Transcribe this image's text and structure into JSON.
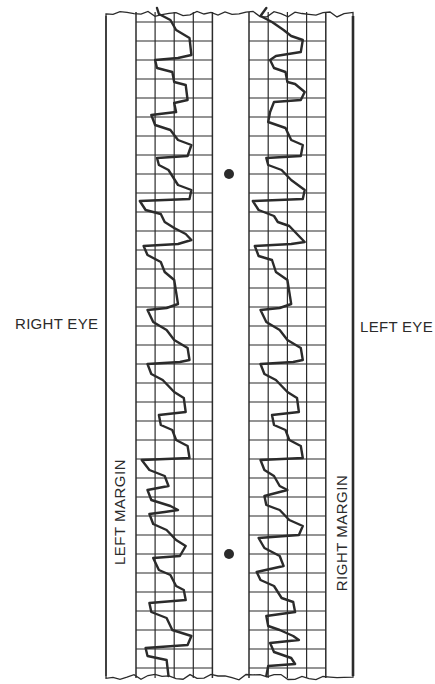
{
  "labels": {
    "right_eye": "RIGHT EYE",
    "left_eye": "LEFT EYE",
    "left_margin": "LEFT MARGIN",
    "right_margin": "RIGHT MARGIN"
  },
  "colors": {
    "ink": "#2b2b2b",
    "paper": "#ffffff"
  },
  "chart_data": {
    "type": "line",
    "title": "",
    "grid": {
      "columns": 4,
      "row_pitch_px": 19,
      "on": true
    },
    "strips": [
      {
        "name": "Right eye",
        "margin_label": "LEFT MARGIN",
        "marker_dots_y": [
          174,
          554
        ]
      },
      {
        "name": "Left eye",
        "margin_label": "RIGHT MARGIN"
      }
    ],
    "series": [
      {
        "name": "Right eye trace",
        "x_units": "grid columns from left margin (0-4)",
        "points": [
          [
            1.1,
            8
          ],
          [
            1.2,
            14
          ],
          [
            1.8,
            20
          ],
          [
            2.1,
            30
          ],
          [
            2.8,
            38
          ],
          [
            2.9,
            55
          ],
          [
            2.2,
            58
          ],
          [
            1.0,
            60
          ],
          [
            1.1,
            68
          ],
          [
            1.9,
            72
          ],
          [
            2.0,
            82
          ],
          [
            2.6,
            85
          ],
          [
            2.7,
            100
          ],
          [
            2.0,
            103
          ],
          [
            2.1,
            112
          ],
          [
            0.8,
            115
          ],
          [
            1.0,
            125
          ],
          [
            1.8,
            130
          ],
          [
            2.2,
            140
          ],
          [
            2.9,
            145
          ],
          [
            2.7,
            156
          ],
          [
            1.1,
            158
          ],
          [
            1.2,
            165
          ],
          [
            1.7,
            170
          ],
          [
            2.2,
            185
          ],
          [
            2.9,
            190
          ],
          [
            2.8,
            199
          ],
          [
            0.2,
            201
          ],
          [
            0.5,
            210
          ],
          [
            1.3,
            214
          ],
          [
            1.5,
            222
          ],
          [
            2.0,
            228
          ],
          [
            2.6,
            234
          ],
          [
            2.9,
            240
          ],
          [
            2.2,
            244
          ],
          [
            0.4,
            246
          ],
          [
            0.6,
            255
          ],
          [
            1.3,
            262
          ],
          [
            1.5,
            272
          ],
          [
            2.0,
            280
          ],
          [
            2.1,
            292
          ],
          [
            2.2,
            304
          ],
          [
            1.6,
            308
          ],
          [
            0.6,
            310
          ],
          [
            0.9,
            322
          ],
          [
            1.6,
            330
          ],
          [
            2.0,
            340
          ],
          [
            2.7,
            348
          ],
          [
            2.8,
            360
          ],
          [
            2.3,
            362
          ],
          [
            0.6,
            364
          ],
          [
            0.8,
            374
          ],
          [
            1.4,
            380
          ],
          [
            2.0,
            392
          ],
          [
            2.5,
            398
          ],
          [
            2.6,
            412
          ],
          [
            1.2,
            415
          ],
          [
            1.3,
            425
          ],
          [
            1.9,
            430
          ],
          [
            2.1,
            440
          ],
          [
            2.7,
            446
          ],
          [
            2.8,
            458
          ],
          [
            0.3,
            460
          ],
          [
            0.7,
            470
          ],
          [
            1.5,
            476
          ],
          [
            1.7,
            486
          ],
          [
            0.6,
            490
          ],
          [
            0.8,
            500
          ],
          [
            1.8,
            506
          ],
          [
            2.2,
            510
          ],
          [
            1.5,
            512
          ],
          [
            0.7,
            514
          ],
          [
            0.9,
            524
          ],
          [
            1.6,
            530
          ],
          [
            2.1,
            540
          ],
          [
            2.6,
            546
          ],
          [
            2.3,
            556
          ],
          [
            0.9,
            558
          ],
          [
            1.2,
            570
          ],
          [
            1.8,
            575
          ],
          [
            2.1,
            586
          ],
          [
            2.5,
            590
          ],
          [
            2.6,
            600
          ],
          [
            0.7,
            603
          ],
          [
            0.8,
            612
          ],
          [
            1.6,
            618
          ],
          [
            1.9,
            630
          ],
          [
            2.9,
            636
          ],
          [
            2.7,
            645
          ],
          [
            0.5,
            648
          ],
          [
            0.6,
            656
          ],
          [
            1.6,
            660
          ],
          [
            1.7,
            676
          ]
        ]
      },
      {
        "name": "Left eye trace",
        "x_units": "grid columns from left margin (0-4)",
        "points": [
          [
            0.9,
            8
          ],
          [
            0.6,
            16
          ],
          [
            1.2,
            22
          ],
          [
            1.8,
            30
          ],
          [
            2.2,
            36
          ],
          [
            2.8,
            40
          ],
          [
            2.7,
            52
          ],
          [
            1.4,
            56
          ],
          [
            1.1,
            60
          ],
          [
            1.3,
            68
          ],
          [
            1.9,
            72
          ],
          [
            2.0,
            82
          ],
          [
            2.4,
            84
          ],
          [
            2.9,
            92
          ],
          [
            2.7,
            100
          ],
          [
            1.3,
            102
          ],
          [
            1.1,
            112
          ],
          [
            1.0,
            122
          ],
          [
            1.9,
            128
          ],
          [
            2.2,
            140
          ],
          [
            2.8,
            145
          ],
          [
            2.7,
            156
          ],
          [
            0.9,
            158
          ],
          [
            1.0,
            165
          ],
          [
            1.7,
            170
          ],
          [
            2.2,
            180
          ],
          [
            2.9,
            190
          ],
          [
            2.8,
            199
          ],
          [
            0.2,
            201
          ],
          [
            0.5,
            210
          ],
          [
            1.3,
            216
          ],
          [
            1.5,
            222
          ],
          [
            2.1,
            226
          ],
          [
            2.6,
            236
          ],
          [
            2.9,
            242
          ],
          [
            2.2,
            244
          ],
          [
            0.3,
            246
          ],
          [
            0.5,
            256
          ],
          [
            1.2,
            260
          ],
          [
            1.4,
            272
          ],
          [
            2.0,
            280
          ],
          [
            2.1,
            292
          ],
          [
            2.2,
            304
          ],
          [
            1.6,
            308
          ],
          [
            0.6,
            310
          ],
          [
            0.9,
            322
          ],
          [
            1.6,
            330
          ],
          [
            2.0,
            340
          ],
          [
            2.7,
            348
          ],
          [
            2.8,
            360
          ],
          [
            2.3,
            362
          ],
          [
            0.6,
            364
          ],
          [
            0.8,
            374
          ],
          [
            1.4,
            380
          ],
          [
            2.0,
            392
          ],
          [
            2.5,
            398
          ],
          [
            2.6,
            412
          ],
          [
            1.2,
            415
          ],
          [
            1.3,
            425
          ],
          [
            1.9,
            430
          ],
          [
            2.1,
            440
          ],
          [
            2.7,
            446
          ],
          [
            2.8,
            458
          ],
          [
            0.6,
            460
          ],
          [
            0.8,
            470
          ],
          [
            1.3,
            476
          ],
          [
            1.6,
            486
          ],
          [
            2.0,
            490
          ],
          [
            0.8,
            496
          ],
          [
            0.9,
            505
          ],
          [
            1.6,
            510
          ],
          [
            2.1,
            520
          ],
          [
            2.8,
            526
          ],
          [
            2.6,
            535
          ],
          [
            0.5,
            538
          ],
          [
            0.8,
            548
          ],
          [
            1.6,
            556
          ],
          [
            1.8,
            566
          ],
          [
            0.4,
            572
          ],
          [
            0.6,
            580
          ],
          [
            1.3,
            586
          ],
          [
            1.7,
            598
          ],
          [
            2.3,
            602
          ],
          [
            2.4,
            612
          ],
          [
            0.9,
            616
          ],
          [
            1.0,
            626
          ],
          [
            1.6,
            630
          ],
          [
            2.3,
            636
          ],
          [
            2.6,
            640
          ],
          [
            1.1,
            643
          ],
          [
            1.3,
            652
          ],
          [
            2.2,
            658
          ],
          [
            2.4,
            664
          ],
          [
            1.0,
            666
          ],
          [
            0.9,
            676
          ]
        ]
      }
    ]
  }
}
